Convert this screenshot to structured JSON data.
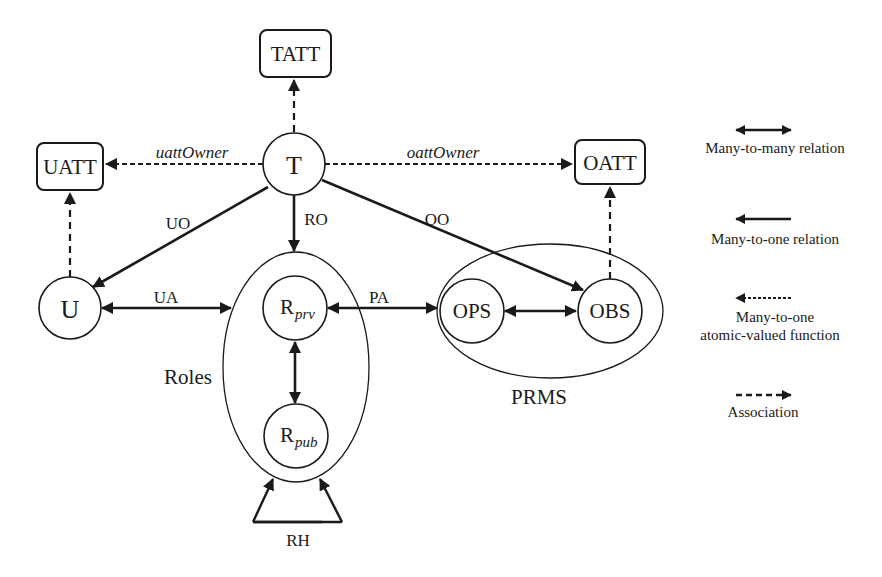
{
  "diagram": {
    "nodes": {
      "T": {
        "label": "T"
      },
      "U": {
        "label": "U"
      },
      "TATT": {
        "label": "TATT"
      },
      "UATT": {
        "label": "UATT"
      },
      "OATT": {
        "label": "OATT"
      },
      "R_prv": {
        "label": "R",
        "subscript": "prv"
      },
      "R_pub": {
        "label": "R",
        "subscript": "pub"
      },
      "OPS": {
        "label": "OPS"
      },
      "OBS": {
        "label": "OBS"
      }
    },
    "groups": {
      "roles": {
        "label": "Roles"
      },
      "prms": {
        "label": "PRMS"
      }
    },
    "edges": {
      "uattOwner": {
        "label": "uattOwner",
        "from": "T",
        "to": "UATT",
        "type": "many-to-one atomic-valued function"
      },
      "oattOwner": {
        "label": "oattOwner",
        "from": "T",
        "to": "OATT",
        "type": "many-to-one atomic-valued function"
      },
      "tatt": {
        "label": "",
        "from": "T",
        "to": "TATT",
        "type": "association"
      },
      "uatt": {
        "label": "",
        "from": "U",
        "to": "UATT",
        "type": "association"
      },
      "oatt": {
        "label": "",
        "from": "OBS",
        "to": "OATT",
        "type": "association"
      },
      "UO": {
        "label": "UO",
        "from": "T",
        "to": "U",
        "type": "many-to-one relation"
      },
      "RO": {
        "label": "RO",
        "from": "T",
        "to": "Roles",
        "type": "many-to-one relation"
      },
      "OO": {
        "label": "OO",
        "from": "T",
        "to": "OBS",
        "type": "many-to-one relation"
      },
      "UA": {
        "label": "UA",
        "from": "U",
        "to": "Roles",
        "type": "many-to-many relation"
      },
      "PA": {
        "label": "PA",
        "from": "R_prv",
        "to": "PRMS",
        "type": "many-to-many relation"
      },
      "prv_pub": {
        "label": "",
        "from": "R_prv",
        "to": "R_pub",
        "type": "many-to-many relation"
      },
      "ops_obs": {
        "label": "",
        "from": "OPS",
        "to": "OBS",
        "type": "many-to-many relation"
      },
      "RH": {
        "label": "RH",
        "from": "Roles",
        "to": "Roles",
        "type": "many-to-many relation"
      }
    }
  },
  "legend": {
    "items": [
      {
        "label": "Many-to-many relation",
        "icon": "double-headed-solid-arrow"
      },
      {
        "label": "Many-to-one relation",
        "icon": "left-solid-arrow"
      },
      {
        "label_line1": "Many-to-one",
        "label_line2": "atomic-valued function",
        "icon": "left-dotted-arrow"
      },
      {
        "label": "Association",
        "icon": "right-dashed-arrow"
      }
    ]
  },
  "colors": {
    "stroke": "#1a1a1a",
    "background": "#ffffff"
  }
}
